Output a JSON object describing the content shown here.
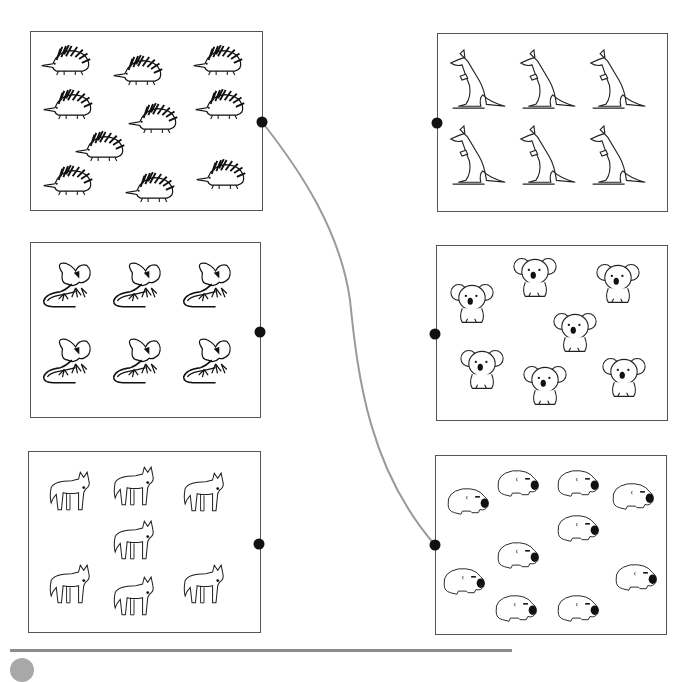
{
  "worksheet": {
    "task": "match-groups-with-equal-count",
    "line_color": "#9a9a9a",
    "dot_color": "#111111",
    "left_panels": [
      {
        "id": "echidnas",
        "animal": "echidna",
        "icon": "echidna-icon",
        "count": 10
      },
      {
        "id": "lizards",
        "animal": "frill-necked lizard",
        "icon": "lizard-icon",
        "count": 6
      },
      {
        "id": "dingoes",
        "animal": "dingo",
        "icon": "dingo-icon",
        "count": 7
      }
    ],
    "right_panels": [
      {
        "id": "kangaroos",
        "animal": "kangaroo",
        "icon": "kangaroo-icon",
        "count": 6
      },
      {
        "id": "koalas",
        "animal": "koala",
        "icon": "koala-icon",
        "count": 7
      },
      {
        "id": "wombats",
        "animal": "wombat",
        "icon": "wombat-icon",
        "count": 10
      }
    ],
    "connections": [
      {
        "from": "echidnas",
        "to": "wombats"
      }
    ]
  }
}
